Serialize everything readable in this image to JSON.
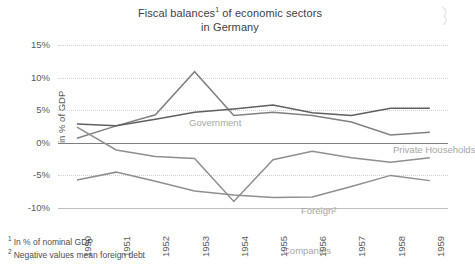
{
  "chart_data": {
    "type": "line",
    "title_line1": "Fiscal balances",
    "title_line1_sup": "1",
    "title_line1_rest": " of economic sectors",
    "title_line2": "in Germany",
    "xlabel": "",
    "ylabel": "in % of GDP",
    "categories": [
      "1950",
      "1951",
      "1952",
      "1953",
      "1954",
      "1955",
      "1956",
      "1957",
      "1958",
      "1959"
    ],
    "ylim": [
      -10,
      15
    ],
    "yticks": [
      15,
      10,
      5,
      0,
      -5,
      -10
    ],
    "ytick_labels": [
      "15%",
      "10%",
      "5%",
      "0%",
      "-5%",
      "-10%"
    ],
    "grid": true,
    "legend_position": "inline-labels",
    "series": [
      {
        "name": "Government",
        "color": "#808080",
        "values": [
          0.7,
          2.6,
          4.3,
          10.9,
          4.2,
          4.7,
          4.2,
          3.2,
          1.2,
          1.6
        ]
      },
      {
        "name": "Private Households",
        "color": "#606060",
        "values": [
          2.9,
          2.6,
          3.6,
          4.7,
          5.2,
          5.8,
          4.6,
          4.2,
          5.3,
          5.3
        ]
      },
      {
        "name": "Foreign²",
        "color": "#8f8f8f",
        "values": [
          2.4,
          -1.1,
          -2.1,
          -2.4,
          -9.0,
          -2.6,
          -1.3,
          -2.3,
          -3.0,
          -2.3
        ]
      },
      {
        "name": "Companies",
        "color": "#8f8f8f",
        "values": [
          -5.7,
          -4.5,
          -5.9,
          -7.4,
          -8.0,
          -8.4,
          -8.3,
          -6.7,
          -5.0,
          -5.8
        ]
      }
    ],
    "annotations": [
      {
        "text": "Government",
        "x_px": 131,
        "y_px": 72
      },
      {
        "text": "Private Households",
        "x_px": 335,
        "y_px": 99
      },
      {
        "text": "Foreign²",
        "x_px": 243,
        "y_px": 160
      },
      {
        "text": "Companies",
        "x_px": 225,
        "y_px": 200
      }
    ]
  },
  "footnotes": {
    "note1_marker": "1",
    "note1_text": "In % of nominal GDP",
    "note2_marker": "2",
    "note2_text": "Negative values mean foreign debt"
  },
  "colors": {
    "background": "#ffffff",
    "text": "#595959",
    "grid": "#d2d2d2",
    "zero_axis": "#7f7f7f",
    "annotation": "#a6a6a6"
  }
}
